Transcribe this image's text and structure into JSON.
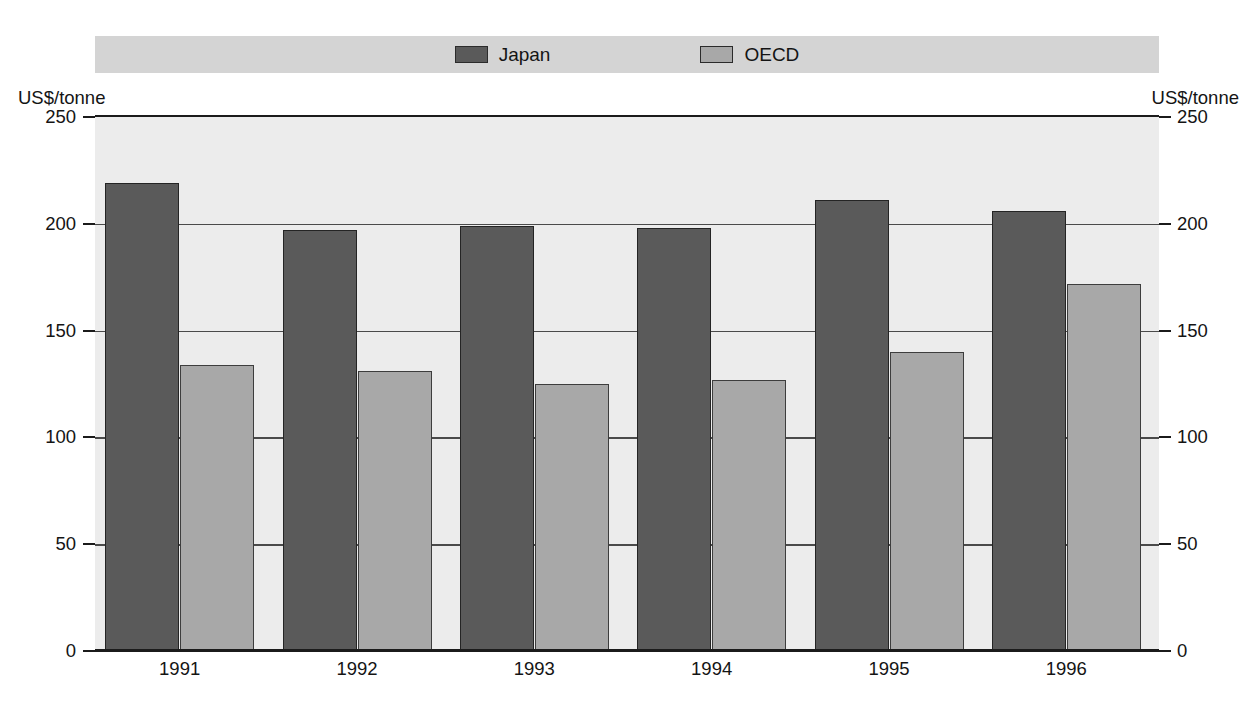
{
  "legend": {
    "entries": [
      {
        "label": "Japan",
        "color": "#5a5a5a",
        "swatch_name": "legend-swatch-japan"
      },
      {
        "label": "OECD",
        "color": "#a8a8a8",
        "swatch_name": "legend-swatch-oecd"
      }
    ]
  },
  "axes": {
    "left_unit": "US$/tonne",
    "right_unit": "US$/tonne",
    "y_ticks": [
      "250",
      "200",
      "150",
      "100",
      "50",
      "0"
    ]
  },
  "chart_data": {
    "type": "bar",
    "title": "",
    "subtitle": "",
    "xlabel": "",
    "ylabel": "US$/tonne",
    "y2label": "US$/tonne",
    "ylim": [
      0,
      250
    ],
    "yticks": [
      0,
      50,
      100,
      150,
      200,
      250
    ],
    "grid": true,
    "grid_axis": "y",
    "legend_position": "top",
    "categories": [
      "1991",
      "1992",
      "1993",
      "1994",
      "1995",
      "1996"
    ],
    "series": [
      {
        "name": "Japan",
        "color": "#5a5a5a",
        "values": [
          219,
          197,
          199,
          198,
          211,
          206
        ]
      },
      {
        "name": "OECD",
        "color": "#a8a8a8",
        "values": [
          134,
          131,
          125,
          127,
          140,
          172
        ]
      }
    ]
  }
}
